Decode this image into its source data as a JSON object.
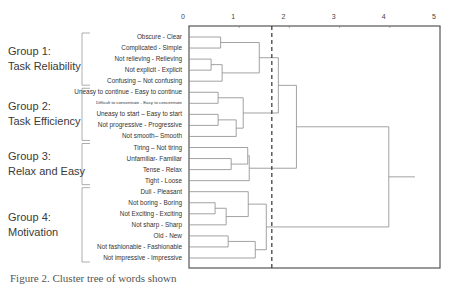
{
  "chart_data": {
    "type": "dendrogram",
    "title": "",
    "xlabel": "",
    "ylabel": "",
    "xlim": [
      0,
      5
    ],
    "x_ticks": [
      "0",
      "1",
      "2",
      "3",
      "4",
      "5"
    ],
    "cut_line": 1.65,
    "leaves": [
      "Obscure - Clear",
      "Complicated - Simple",
      "Not relieving - Relieving",
      "Not explicit - Explicit",
      "Confusing – Not confusing",
      "Uneasy to continue - Easy to continue",
      "Difficult to concentrate - Easy to concentrate",
      "Uneasy to start – Easy to start",
      "Not progressive - Progressive",
      "Not smooth– Smooth",
      "Tiring – Not tiring",
      "Unfamiliar- Familiar",
      "Tense - Relax",
      "Tight - Loose",
      "Dull - Pleasant",
      "Not boring - Boring",
      "Not Exciting - Exciting",
      "Not sharp - Sharp",
      "Old - New",
      "Not fashionable - Fashionable",
      "Not impressive - Impressive"
    ],
    "groups": [
      {
        "name": "Group 1:",
        "subtitle": "Task Reliability",
        "leaf_range": [
          0,
          4
        ]
      },
      {
        "name": "Group 2:",
        "subtitle": "Task Efficiency",
        "leaf_range": [
          5,
          9
        ]
      },
      {
        "name": "Group 3:",
        "subtitle": "Relax and Easy",
        "leaf_range": [
          10,
          13
        ]
      },
      {
        "name": "Group 4:",
        "subtitle": "Motivation",
        "leaf_range": [
          14,
          20
        ]
      }
    ],
    "merges": [
      {
        "a": "L0",
        "b": "L1",
        "height": 0.63,
        "id": "A"
      },
      {
        "a": "L2",
        "b": "L3",
        "height": 0.44,
        "id": "B"
      },
      {
        "a": "B",
        "b": "L4",
        "height": 0.66,
        "id": "C"
      },
      {
        "a": "A",
        "b": "C",
        "height": 1.4,
        "id": "G1"
      },
      {
        "a": "L5",
        "b": "L6",
        "height": 0.58,
        "id": "D"
      },
      {
        "a": "L7",
        "b": "L8",
        "height": 0.58,
        "id": "E"
      },
      {
        "a": "E",
        "b": "L9",
        "height": 0.94,
        "id": "F"
      },
      {
        "a": "D",
        "b": "F",
        "height": 1.08,
        "id": "G2"
      },
      {
        "a": "G1",
        "b": "G2",
        "height": 1.78,
        "id": "G12"
      },
      {
        "a": "L11",
        "b": "L12",
        "height": 0.84,
        "id": "H"
      },
      {
        "a": "L10",
        "b": "H",
        "height": 1.17,
        "id": "I"
      },
      {
        "a": "I",
        "b": "L13",
        "height": 1.2,
        "id": "G3"
      },
      {
        "a": "G12",
        "b": "G3",
        "height": 2.14,
        "id": "G123"
      },
      {
        "a": "L15",
        "b": "L16",
        "height": 0.52,
        "id": "J"
      },
      {
        "a": "J",
        "b": "L17",
        "height": 0.74,
        "id": "K"
      },
      {
        "a": "L14",
        "b": "K",
        "height": 1.18,
        "id": "M"
      },
      {
        "a": "L18",
        "b": "L19",
        "height": 0.78,
        "id": "N"
      },
      {
        "a": "N",
        "b": "L20",
        "height": 1.32,
        "id": "O"
      },
      {
        "a": "M",
        "b": "O",
        "height": 1.54,
        "id": "G4"
      },
      {
        "a": "G123",
        "b": "G4",
        "height": 3.98,
        "id": "ROOT"
      }
    ],
    "root_tail": 4.5
  },
  "caption": "Figure 2. Cluster tree of words shown"
}
